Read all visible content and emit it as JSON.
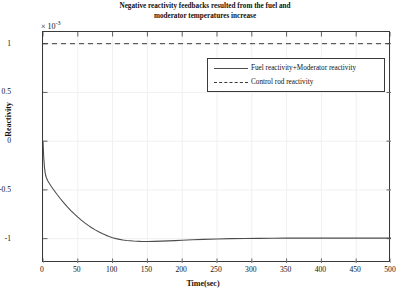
{
  "chart_data": {
    "type": "line",
    "title": "Negative reactivity feedbacks resulted from the fuel and moderator temperatures increase",
    "title_line1": "Negative reactivity feedbacks resulted from the fuel and",
    "title_line2": "moderator temperatures increase",
    "xlabel": "Time(sec)",
    "ylabel": "Reactivity",
    "y_multiplier": "× 10",
    "y_multiplier_exp": "-3",
    "xlim": [
      0,
      500
    ],
    "ylim": [
      -1.25,
      1.12
    ],
    "xticks": [
      0,
      50,
      100,
      150,
      200,
      250,
      300,
      350,
      400,
      450,
      500
    ],
    "xticklabels": [
      "0",
      "50",
      "100",
      "150",
      "200",
      "250",
      "300",
      "350",
      "400",
      "450",
      "500"
    ],
    "yticks": [
      1,
      0.5,
      0,
      -0.5,
      -1
    ],
    "yticklabels": [
      "1",
      "0.5",
      "0",
      "-0.5",
      "-1"
    ],
    "grid": true,
    "legend_position": "upper-center-right",
    "series": [
      {
        "name": "Fuel reactivity+Moderator reactivity",
        "style": "solid",
        "color": "#4d4d4d",
        "x": [
          0,
          1,
          2,
          3,
          4,
          5,
          7,
          9,
          12,
          15,
          20,
          25,
          30,
          35,
          40,
          45,
          50,
          55,
          60,
          65,
          70,
          75,
          80,
          85,
          90,
          95,
          100,
          105,
          110,
          115,
          120,
          130,
          140,
          150,
          160,
          170,
          180,
          190,
          200,
          215,
          230,
          250,
          270,
          290,
          310,
          330,
          350,
          375,
          400,
          430,
          460,
          500
        ],
        "y": [
          0,
          -0.16,
          -0.26,
          -0.32,
          -0.355,
          -0.378,
          -0.408,
          -0.432,
          -0.465,
          -0.496,
          -0.545,
          -0.591,
          -0.634,
          -0.674,
          -0.712,
          -0.747,
          -0.78,
          -0.81,
          -0.838,
          -0.864,
          -0.888,
          -0.91,
          -0.93,
          -0.948,
          -0.964,
          -0.978,
          -0.99,
          -1.0,
          -1.008,
          -1.014,
          -1.019,
          -1.025,
          -1.028,
          -1.029,
          -1.028,
          -1.026,
          -1.023,
          -1.02,
          -1.017,
          -1.012,
          -1.008,
          -1.003,
          -1.0,
          -0.998,
          -0.997,
          -0.996,
          -0.995,
          -0.995,
          -0.995,
          -0.995,
          -0.995,
          -0.995
        ]
      },
      {
        "name": "Control rod reactivity",
        "style": "dashed",
        "color": "#3a3a3a",
        "x": [
          0,
          500
        ],
        "y": [
          1.0,
          1.0
        ]
      }
    ]
  },
  "legend": {
    "items": [
      {
        "label": "Fuel reactivity+Moderator reactivity",
        "style": "solid"
      },
      {
        "label": "Control rod reactivity",
        "style": "dashed"
      }
    ]
  }
}
